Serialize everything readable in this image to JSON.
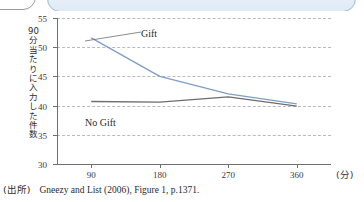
{
  "banner": {
    "title": "",
    "tab_label": ""
  },
  "chart_data": {
    "type": "line",
    "title": "",
    "xlabel": "",
    "ylabel": "90分当たりに入力した件数",
    "x_unit": "(分)",
    "categories": [
      "90",
      "180",
      "270",
      "360"
    ],
    "x": [
      90,
      180,
      270,
      360
    ],
    "xlim": [
      45,
      405
    ],
    "ylim": [
      30,
      55
    ],
    "yticks": [
      "55",
      "50",
      "45",
      "40",
      "35",
      "30"
    ],
    "ytick_values": [
      55,
      50,
      45,
      40,
      35,
      30
    ],
    "grid": true,
    "legend_position": "inline-annotation",
    "series": [
      {
        "name": "Gift",
        "color": "#7d9fc4",
        "values": [
          51.6,
          45.0,
          42.0,
          40.3
        ]
      },
      {
        "name": "No Gift",
        "color": "#6d6d6d",
        "values": [
          40.7,
          40.6,
          41.5,
          39.9
        ]
      }
    ]
  },
  "source": {
    "prefix": "(出所)",
    "text": "Gneezy and List (2006), Figure 1, p.1371."
  }
}
